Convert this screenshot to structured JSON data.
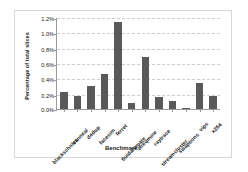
{
  "chart_data": {
    "type": "bar",
    "title": "",
    "xlabel": "Benchmarks",
    "ylabel": "Percentage of total slices",
    "categories": [
      "blackscholes",
      "canneal",
      "dedup",
      "facesim",
      "ferret",
      "fluidanimate",
      "freqmine",
      "raytrace",
      "streamcluster",
      "swaptions",
      "vips",
      "x264"
    ],
    "values": [
      0.22,
      0.17,
      0.3,
      0.46,
      1.14,
      0.08,
      0.68,
      0.16,
      0.11,
      0.01,
      0.34,
      0.17
    ],
    "value_unit": "%",
    "ylim": [
      0,
      1.2
    ],
    "ytick_values": [
      0.0,
      0.2,
      0.4,
      0.6,
      0.8,
      1.0,
      1.2
    ],
    "ytick_labels": [
      "0.0%",
      "0.2%",
      "0.4%",
      "0.6%",
      "0.8%",
      "1.0%",
      "1.2%"
    ],
    "grid": true,
    "legend": false,
    "bar_color": "#595959",
    "grid_color": "#cfcfcf",
    "axis_color": "#9a9a9a",
    "plot_background": "#ffffff"
  }
}
